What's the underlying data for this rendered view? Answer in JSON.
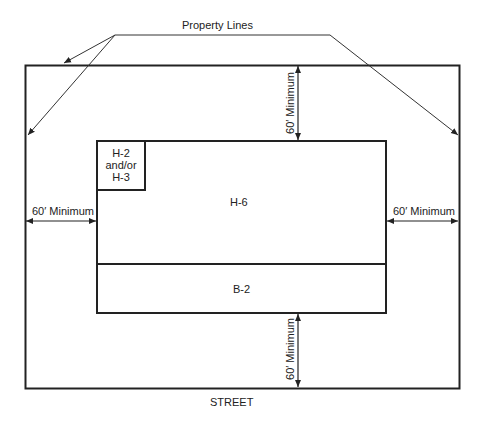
{
  "title": "Property Lines",
  "street_label": "STREET",
  "zones": {
    "small": [
      "H-2",
      "and/or",
      "H-3"
    ],
    "main": "H-6",
    "bottom": "B-2"
  },
  "setbacks": {
    "top": "60′ Minimum",
    "left": "60′ Minimum",
    "right": "60′ Minimum",
    "bottom": "60′ Minimum"
  },
  "colors": {
    "line": "#222222",
    "background": "#ffffff"
  }
}
